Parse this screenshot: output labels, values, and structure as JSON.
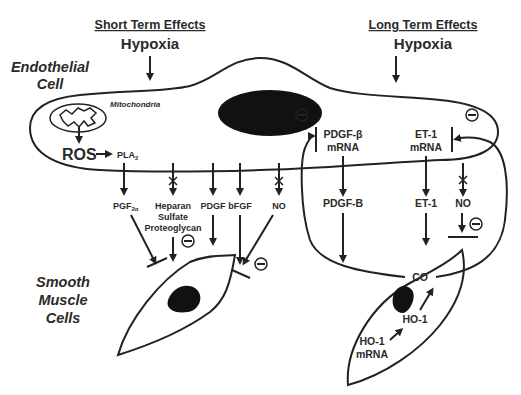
{
  "headers": {
    "short_term": "Short Term Effects",
    "long_term": "Long Term Effects",
    "hypoxia_left": "Hypoxia",
    "hypoxia_right": "Hypoxia"
  },
  "cell_labels": {
    "endothelial_line1": "Endothelial",
    "endothelial_line2": "Cell",
    "smooth_line1": "Smooth",
    "smooth_line2": "Muscle",
    "smooth_line3": "Cells"
  },
  "endothelial": {
    "mitochondria": "Mitochondria",
    "ros": "ROS",
    "pla2": "PLA",
    "pla2_sub": "2",
    "pdgf_beta_mrna_line1": "PDGF-β",
    "pdgf_beta_mrna_line2": "mRNA",
    "et1_mrna_line1": "ET-1",
    "et1_mrna_line2": "mRNA"
  },
  "short_term_mediators": {
    "pgf": "PGF",
    "pgf_sub": "2α",
    "heparan_line1": "Heparan",
    "heparan_line2": "Sulfate",
    "heparan_line3": "Proteoglycan",
    "pdgf": "PDGF",
    "bfgf": "bFGF",
    "no": "NO"
  },
  "long_term_mediators": {
    "pdgf_b": "PDGF-B",
    "et1": "ET-1",
    "no": "NO",
    "co": "CO",
    "ho1": "HO-1",
    "ho1_mrna_line1": "HO-1",
    "ho1_mrna_line2": "mRNA"
  },
  "symbols": {
    "inhibit": "−"
  }
}
